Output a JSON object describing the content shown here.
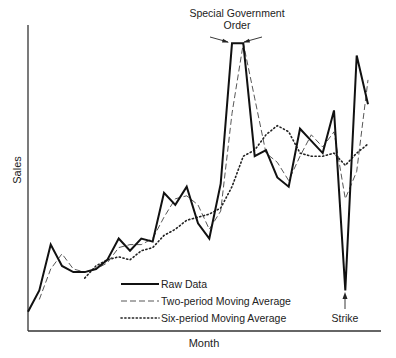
{
  "chart_data": {
    "type": "line",
    "title": "",
    "xlabel": "Month",
    "ylabel": "Sales",
    "ylim": [
      0,
      100
    ],
    "grid": false,
    "legend_position": "lower-center-inside",
    "x": [
      1,
      2,
      3,
      4,
      5,
      6,
      7,
      8,
      9,
      10,
      11,
      12,
      13,
      14,
      15,
      16,
      17,
      18,
      19,
      20,
      21,
      22,
      23,
      24,
      25,
      26,
      27,
      28,
      29,
      30,
      31
    ],
    "series": [
      {
        "name": "Raw Data",
        "style": "solid-thick",
        "values": [
          6,
          13,
          28,
          21,
          19,
          19,
          20,
          23,
          30,
          26,
          30,
          29,
          45,
          41,
          47,
          35,
          30,
          48,
          94,
          94,
          57,
          59,
          50,
          47,
          66,
          62,
          58,
          72,
          13,
          90,
          74
        ]
      },
      {
        "name": "Two-period Moving Average",
        "style": "dashed",
        "values": [
          null,
          10,
          20,
          25,
          20,
          19,
          20,
          22,
          27,
          28,
          28,
          30,
          37,
          43,
          44,
          41,
          33,
          39,
          71,
          94,
          76,
          58,
          55,
          49,
          57,
          64,
          60,
          65,
          43,
          52,
          82
        ]
      },
      {
        "name": "Six-period Moving Average",
        "style": "dotted",
        "values": [
          null,
          null,
          null,
          null,
          null,
          17,
          21,
          23,
          24,
          23,
          26,
          27,
          31,
          33,
          36,
          37,
          38,
          40,
          47,
          57,
          59,
          64,
          67,
          65,
          58,
          57,
          57,
          58,
          54,
          58,
          61
        ]
      }
    ],
    "annotations": [
      {
        "text_line1": "Special Government",
        "text_line2": "Order",
        "target": "peak at months 19-20"
      },
      {
        "text": "Strike",
        "target": "dip at month 29"
      }
    ]
  },
  "labels": {
    "xlabel": "Month",
    "ylabel": "Sales",
    "annotation_order_line1": "Special Government",
    "annotation_order_line2": "Order",
    "annotation_strike": "Strike",
    "legend_raw": "Raw Data",
    "legend_two": "Two-period Moving Average",
    "legend_six": "Six-period Moving Average"
  },
  "colors": {
    "line": "#1a1a1a",
    "axis": "#333333",
    "background": "#ffffff"
  }
}
